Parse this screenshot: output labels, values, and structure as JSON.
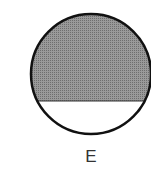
{
  "figure": {
    "label": "E",
    "shape": "circle",
    "fill_fraction_description": "shaded upper portion, unshaded lower segment",
    "colors": {
      "shaded": "#8a8a8a",
      "unshaded": "#ffffff",
      "outline": "#111111"
    }
  }
}
